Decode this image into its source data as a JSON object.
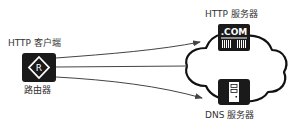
{
  "diagram": {
    "type": "network",
    "colors": {
      "node_fill": "#1a1a1a",
      "node_glyph": "#ffffff",
      "line": "#444444",
      "cloud_stroke": "#111111",
      "background": "#ffffff"
    },
    "nodes": {
      "client": {
        "title": "HTTP 客户端",
        "device_label": "路由器",
        "icon": "router-icon",
        "glyph": "R"
      },
      "http_server": {
        "title": "HTTP 服务器",
        "icon": "web-server-icon",
        "glyph": ".COM"
      },
      "dns_server": {
        "title": "DNS 服务器",
        "icon": "dns-server-icon"
      }
    },
    "cloud": {
      "icon": "internet-cloud-icon"
    },
    "edges": [
      {
        "from": "client",
        "to": "http_server",
        "arrow": true
      },
      {
        "from": "client",
        "to": "cloud",
        "arrow": false
      },
      {
        "from": "client",
        "to": "dns_server",
        "arrow": true
      }
    ]
  }
}
